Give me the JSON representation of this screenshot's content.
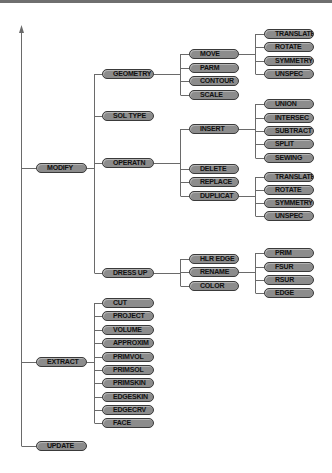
{
  "diagram": {
    "root": [
      {
        "label": "MODIFY",
        "y": 168,
        "children": [
          {
            "label": "GEOMETRY",
            "y": 74,
            "children": [
              {
                "label": "MOVE",
                "y": 54,
                "children": [
                  {
                    "label": "TRANSLATE",
                    "y": 34
                  },
                  {
                    "label": "ROTATE",
                    "y": 47
                  },
                  {
                    "label": "SYMMETRY",
                    "y": 61
                  },
                  {
                    "label": "UNSPEC",
                    "y": 74
                  }
                ]
              },
              {
                "label": "PARM",
                "y": 68
              },
              {
                "label": "CONTOUR",
                "y": 81
              },
              {
                "label": "SCALE",
                "y": 95
              }
            ]
          },
          {
            "label": "SOL TYPE",
            "y": 116
          },
          {
            "label": "OPERATN",
            "y": 163,
            "children": [
              {
                "label": "INSERT",
                "y": 129,
                "children": [
                  {
                    "label": "UNION",
                    "y": 104
                  },
                  {
                    "label": "INTERSEC",
                    "y": 118
                  },
                  {
                    "label": "SUBTRACT",
                    "y": 131
                  },
                  {
                    "label": "SPLIT",
                    "y": 144
                  },
                  {
                    "label": "SEWING",
                    "y": 158
                  }
                ]
              },
              {
                "label": "DELETE",
                "y": 169
              },
              {
                "label": "REPLACE",
                "y": 182
              },
              {
                "label": "DUPLICAT",
                "y": 196,
                "children": [
                  {
                    "label": "TRANSLATE",
                    "y": 177
                  },
                  {
                    "label": "ROTATE",
                    "y": 190
                  },
                  {
                    "label": "SYMMETRY",
                    "y": 203
                  },
                  {
                    "label": "UNSPEC",
                    "y": 216
                  }
                ]
              }
            ]
          },
          {
            "label": "DRESS UP",
            "y": 273,
            "children": [
              {
                "label": "HLR EDGE",
                "y": 259
              },
              {
                "label": "RENAME",
                "y": 272,
                "children": [
                  {
                    "label": "PRIM",
                    "y": 253
                  },
                  {
                    "label": "FSUR",
                    "y": 267
                  },
                  {
                    "label": "RSUR",
                    "y": 280
                  },
                  {
                    "label": "EDGE",
                    "y": 293
                  }
                ]
              },
              {
                "label": "COLOR",
                "y": 286
              }
            ]
          }
        ]
      },
      {
        "label": "EXTRACT",
        "y": 362,
        "children": [
          {
            "label": "CUT",
            "y": 303
          },
          {
            "label": "PROJECT",
            "y": 316
          },
          {
            "label": "VOLUME",
            "y": 330
          },
          {
            "label": "APPROXIM",
            "y": 343
          },
          {
            "label": "PRIMVOL",
            "y": 357
          },
          {
            "label": "PRIMSOL",
            "y": 370
          },
          {
            "label": "PRIMSKIN",
            "y": 383
          },
          {
            "label": "EDGESKIN",
            "y": 397
          },
          {
            "label": "EDGECRV",
            "y": 410
          },
          {
            "label": "FACE",
            "y": 423
          }
        ]
      },
      {
        "label": "UPDATE",
        "y": 446
      }
    ]
  },
  "colors": {
    "pill_fill": "#8c8c8c",
    "pill_border": "#3a3a3a",
    "line": "#6a6a6a"
  }
}
